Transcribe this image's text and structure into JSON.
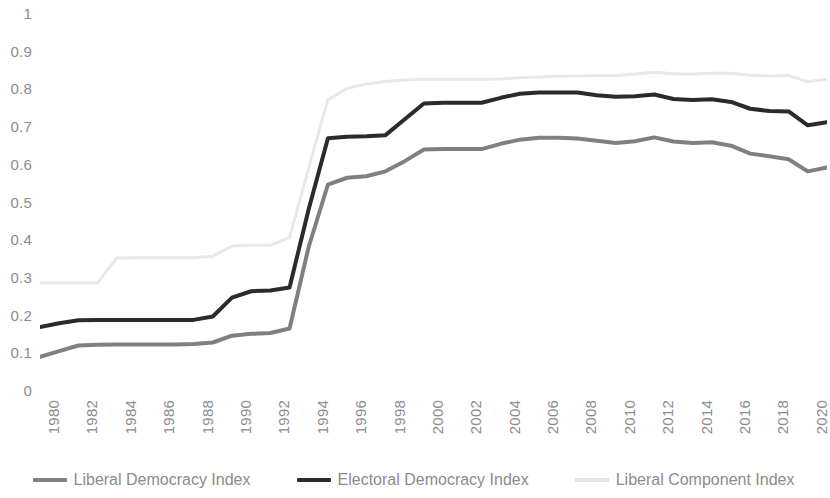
{
  "chart_data": {
    "type": "line",
    "title": "",
    "subtitle": "",
    "xlabel": "",
    "ylabel": "",
    "xlim": [
      1980,
      2021
    ],
    "ylim": [
      0,
      1
    ],
    "grid": false,
    "legend_position": "bottom",
    "y_ticks": [
      "1",
      "0.9",
      "0.8",
      "0.7",
      "0.6",
      "0.5",
      "0.4",
      "0.3",
      "0.2",
      "0.1",
      "0"
    ],
    "y_tick_values": [
      1,
      0.9,
      0.8,
      0.7,
      0.6,
      0.5,
      0.4,
      0.3,
      0.2,
      0.1,
      0
    ],
    "x_ticks": [
      "1980",
      "1982",
      "1984",
      "1986",
      "1988",
      "1990",
      "1992",
      "1994",
      "1996",
      "1998",
      "2000",
      "2002",
      "2004",
      "2006",
      "2008",
      "2010",
      "2012",
      "2014",
      "2016",
      "2018",
      "2020"
    ],
    "x_tick_values": [
      1980,
      1982,
      1984,
      1986,
      1988,
      1990,
      1992,
      1994,
      1996,
      1998,
      2000,
      2002,
      2004,
      2006,
      2008,
      2010,
      2012,
      2014,
      2016,
      2018,
      2020
    ],
    "x": [
      1980,
      1981,
      1982,
      1983,
      1984,
      1985,
      1986,
      1987,
      1988,
      1989,
      1990,
      1991,
      1992,
      1993,
      1994,
      1995,
      1996,
      1997,
      1998,
      1999,
      2000,
      2001,
      2002,
      2003,
      2004,
      2005,
      2006,
      2007,
      2008,
      2009,
      2010,
      2011,
      2012,
      2013,
      2014,
      2015,
      2016,
      2017,
      2018,
      2019,
      2020,
      2021
    ],
    "series": [
      {
        "name": "Liberal Democracy Index",
        "color": "#808080",
        "line_width": 4,
        "values": [
          0.088,
          0.103,
          0.118,
          0.12,
          0.121,
          0.121,
          0.121,
          0.121,
          0.122,
          0.126,
          0.144,
          0.149,
          0.151,
          0.163,
          0.38,
          0.545,
          0.563,
          0.567,
          0.58,
          0.607,
          0.638,
          0.639,
          0.639,
          0.639,
          0.653,
          0.664,
          0.669,
          0.669,
          0.667,
          0.661,
          0.655,
          0.66,
          0.67,
          0.659,
          0.655,
          0.657,
          0.648,
          0.627,
          0.62,
          0.612,
          0.58,
          0.59
        ]
      },
      {
        "name": "Electoral Democracy Index",
        "color": "#2b2b2b",
        "line_width": 4,
        "values": [
          0.167,
          0.177,
          0.185,
          0.186,
          0.186,
          0.186,
          0.186,
          0.186,
          0.186,
          0.195,
          0.245,
          0.262,
          0.264,
          0.272,
          0.48,
          0.668,
          0.672,
          0.673,
          0.676,
          0.718,
          0.76,
          0.762,
          0.762,
          0.762,
          0.775,
          0.786,
          0.789,
          0.789,
          0.789,
          0.782,
          0.778,
          0.779,
          0.784,
          0.772,
          0.769,
          0.771,
          0.764,
          0.746,
          0.74,
          0.739,
          0.702,
          0.71
        ]
      },
      {
        "name": "Liberal Component Index",
        "color": "#e8e8e8",
        "line_width": 3,
        "values": [
          0.284,
          0.284,
          0.284,
          0.284,
          0.35,
          0.351,
          0.351,
          0.351,
          0.351,
          0.355,
          0.382,
          0.384,
          0.384,
          0.404,
          0.59,
          0.77,
          0.8,
          0.812,
          0.818,
          0.822,
          0.824,
          0.824,
          0.824,
          0.824,
          0.825,
          0.828,
          0.83,
          0.832,
          0.833,
          0.834,
          0.834,
          0.838,
          0.843,
          0.839,
          0.838,
          0.84,
          0.84,
          0.835,
          0.833,
          0.834,
          0.818,
          0.824
        ]
      }
    ]
  },
  "legend": {
    "items": [
      {
        "label": "Liberal Democracy Index",
        "color": "#808080"
      },
      {
        "label": "Electoral Democracy Index",
        "color": "#2b2b2b"
      },
      {
        "label": "Liberal Component Index",
        "color": "#e3e3e3"
      }
    ]
  },
  "colors": {
    "background": "#ffffff",
    "tick_text": "#8c8c8c",
    "liberal_democracy": "#808080",
    "electoral_democracy": "#2b2b2b",
    "liberal_component": "#e8e8e8"
  }
}
